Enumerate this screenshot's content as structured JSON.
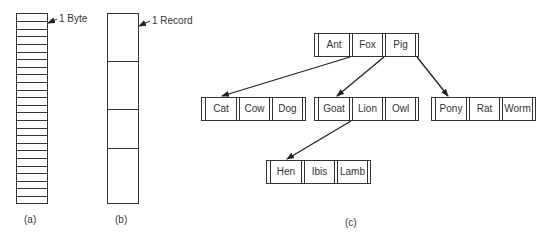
{
  "figure_a": {
    "label": "(a)",
    "annotation": "1 Byte",
    "byte_count": 25
  },
  "figure_b": {
    "label": "(b)",
    "annotation": "1 Record",
    "record_count": 4
  },
  "figure_c": {
    "label": "(c)",
    "tree": {
      "root": {
        "keys": [
          "Ant",
          "Fox",
          "Pig"
        ]
      },
      "level2": [
        {
          "keys": [
            "Cat",
            "Cow",
            "Dog"
          ]
        },
        {
          "keys": [
            "Goat",
            "Lion",
            "Owl"
          ]
        },
        {
          "keys": [
            "Pony",
            "Rat",
            "Worm"
          ]
        }
      ],
      "level3": [
        {
          "keys": [
            "Hen",
            "Ibis",
            "Lamb"
          ]
        }
      ]
    }
  },
  "colors": {
    "line": "#333333",
    "text": "#333333",
    "background": "#ffffff"
  }
}
